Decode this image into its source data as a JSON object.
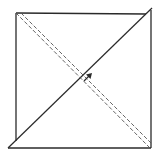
{
  "diagram": {
    "type": "folded-square",
    "colors": {
      "stroke": "#2a2a2a",
      "dashed": "#555555",
      "background": "#ffffff"
    },
    "square": {
      "left": 16,
      "top": 13,
      "right": 151,
      "bottom": 148
    },
    "solid_diagonal": {
      "x1": 8,
      "y1": 148,
      "x2": 152,
      "y2": 8
    },
    "dashed_lines": [
      {
        "x1": 16,
        "y1": 13,
        "x2": 150,
        "y2": 148
      },
      {
        "x1": 21,
        "y1": 13,
        "x2": 152,
        "y2": 144
      }
    ],
    "arrow": {
      "x": 88,
      "y": 77,
      "direction": "up-right"
    }
  }
}
